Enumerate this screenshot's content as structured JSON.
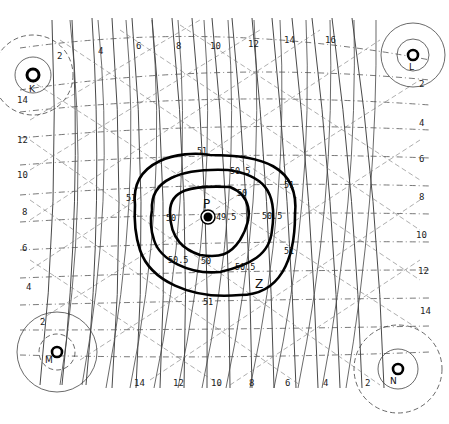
{
  "diagram": {
    "type": "hyperbolic-lattice-contour-map",
    "stations": [
      {
        "id": "K",
        "label": "K",
        "x": 33,
        "y": 75
      },
      {
        "id": "L",
        "label": "L",
        "x": 413,
        "y": 55
      },
      {
        "id": "M",
        "label": "M",
        "x": 57,
        "y": 352
      },
      {
        "id": "N",
        "label": "N",
        "x": 398,
        "y": 369
      }
    ],
    "center_point": {
      "label": "P",
      "value_label": "49.5",
      "x": 208,
      "y": 217
    },
    "marker_z": {
      "label": "Z",
      "x": 260,
      "y": 284
    },
    "top_labels": [
      "2",
      "4",
      "6",
      "8",
      "10",
      "12",
      "14",
      "16"
    ],
    "bottom_labels": [
      "14",
      "12",
      "10",
      "8",
      "6",
      "4",
      "2"
    ],
    "left_labels": [
      "14",
      "12",
      "10",
      "8",
      "6",
      "4",
      "2"
    ],
    "right_labels": [
      "2",
      "4",
      "6",
      "8",
      "10",
      "12",
      "14"
    ],
    "contours": [
      {
        "value": "51",
        "labels": [
          "51",
          "51",
          "51",
          "51",
          "51",
          "51"
        ]
      },
      {
        "value": "50.5",
        "labels": [
          "50.5",
          "50.5",
          "50.5",
          "50.5"
        ]
      },
      {
        "value": "50",
        "labels": [
          "50",
          "50",
          "50"
        ]
      }
    ]
  }
}
